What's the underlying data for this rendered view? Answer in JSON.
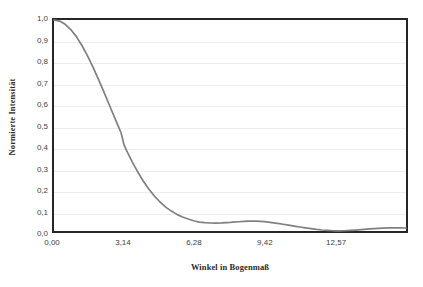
{
  "chart_data": {
    "type": "line",
    "title": "",
    "subtitle": "",
    "xlabel": "Winkel in Bogenmaß",
    "ylabel": "Normierte Intensität",
    "xlim": [
      0,
      15.75
    ],
    "ylim": [
      0,
      1.0
    ],
    "grid": true,
    "grid_axis": "y",
    "legend": "none",
    "series_color": "#808080",
    "frame_color": "#262626",
    "gridline_color": "#eeeeee",
    "background_color": "#ffffff",
    "x_tick_labels": [
      "0,00",
      "3,14",
      "6,28",
      "9,42",
      "12,57"
    ],
    "x_tick_values": [
      0,
      3.14,
      6.28,
      9.42,
      12.57
    ],
    "y_tick_labels": [
      "0,0",
      "0,1",
      "0,2",
      "0,3",
      "0,4",
      "0,5",
      "0,6",
      "0,7",
      "0,8",
      "0,9",
      "1,0"
    ],
    "y_tick_values": [
      0.0,
      0.1,
      0.2,
      0.3,
      0.4,
      0.5,
      0.6,
      0.7,
      0.8,
      0.9,
      1.0
    ],
    "formula": "sinc^2(x/2) = (sin(x/2)/(x/2))^2",
    "series": [
      {
        "name": "Normierte Intensität",
        "color": "#808080",
        "x": [
          0.0,
          0.25,
          0.5,
          0.75,
          1.0,
          1.25,
          1.5,
          1.75,
          2.0,
          2.25,
          2.5,
          2.75,
          3.0,
          3.1416,
          3.25,
          3.5,
          3.75,
          4.0,
          4.25,
          4.5,
          4.7124,
          5.0,
          5.25,
          5.5,
          5.75,
          6.0,
          6.2832,
          6.5,
          6.75,
          7.0,
          7.25,
          7.5,
          7.75,
          7.854,
          8.0,
          8.25,
          8.5,
          8.75,
          9.0,
          9.25,
          9.4248,
          9.75,
          10.0,
          10.25,
          10.5,
          10.75,
          10.9956,
          11.25,
          11.5,
          11.75,
          12.0,
          12.25,
          12.5,
          12.5664,
          12.75,
          13.0,
          13.25,
          13.5,
          13.75,
          14.0,
          14.1372,
          14.5,
          14.75,
          15.0,
          15.25,
          15.5,
          15.708,
          15.75
        ],
        "y": [
          1.0,
          0.9949,
          0.9797,
          0.9549,
          0.9211,
          0.8792,
          0.8303,
          0.7757,
          0.7166,
          0.6546,
          0.5912,
          0.5278,
          0.4656,
          0.4053,
          0.3808,
          0.3276,
          0.2793,
          0.236,
          0.1979,
          0.1649,
          0.1409,
          0.1134,
          0.0944,
          0.0788,
          0.0663,
          0.0566,
          0.0472,
          0.0423,
          0.0394,
          0.0379,
          0.0376,
          0.0383,
          0.0397,
          0.0403,
          0.0417,
          0.0438,
          0.0455,
          0.0464,
          0.0465,
          0.0456,
          0.0441,
          0.0396,
          0.036,
          0.032,
          0.0278,
          0.0235,
          0.019,
          0.0149,
          0.011,
          0.0076,
          0.0048,
          0.0027,
          0.0011,
          0.0008,
          0.0005,
          0.0012,
          0.0027,
          0.0046,
          0.0067,
          0.0089,
          0.0102,
          0.0126,
          0.014,
          0.0148,
          0.0151,
          0.0148,
          0.0143,
          0.0141
        ]
      }
    ]
  }
}
